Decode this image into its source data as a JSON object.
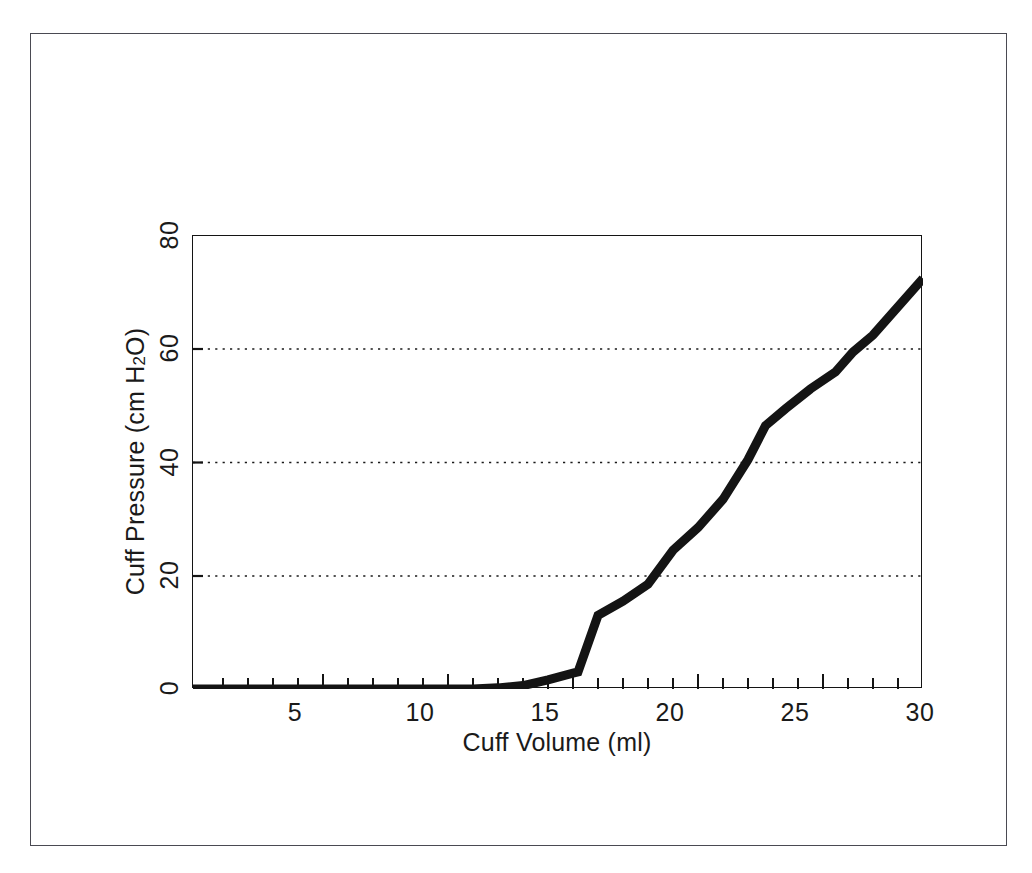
{
  "figure": {
    "background_color": "#ffffff",
    "frame_color": "#4a4a52",
    "axis_color": "#141414"
  },
  "chart_data": {
    "type": "line",
    "title": "",
    "xlabel": "Cuff Volume (ml)",
    "ylabel": "Cuff Pressure (cm H2O)",
    "ylabel_parts": {
      "prefix": "Cuff Pressure (cm H",
      "sub": "2",
      "suffix": "O)"
    },
    "xlim": [
      0.8,
      30
    ],
    "ylim": [
      0,
      80
    ],
    "xticks": [
      5,
      10,
      15,
      20,
      25,
      30
    ],
    "xtick_labels": [
      "5",
      "10",
      "15",
      "20",
      "25",
      "30"
    ],
    "x_minor_tick_step": 1,
    "yticks": [
      0,
      20,
      40,
      60,
      80
    ],
    "ytick_labels": [
      "0",
      "20",
      "40",
      "60",
      "80"
    ],
    "grid": "horizontal-dotted",
    "gridlines_at": [
      20,
      40,
      60
    ],
    "legend": "none",
    "line_color": "#141414",
    "line_width_px": 9,
    "series": [
      {
        "name": "Cuff compliance curve",
        "x": [
          0.8,
          2,
          4,
          6,
          8,
          10,
          12,
          13,
          14,
          15,
          16,
          16.2,
          17,
          18,
          19,
          20,
          21,
          22,
          23,
          23.7,
          24.5,
          25.5,
          26.5,
          27.2,
          28,
          29,
          30
        ],
        "y": [
          0,
          0,
          0,
          0,
          0,
          0,
          0,
          0.2,
          0.6,
          1.6,
          2.8,
          3.0,
          13.0,
          15.5,
          18.5,
          24.5,
          28.5,
          33.5,
          40.5,
          46.5,
          49.5,
          53.0,
          56.0,
          59.5,
          62.5,
          67.5,
          72.5
        ]
      }
    ]
  }
}
